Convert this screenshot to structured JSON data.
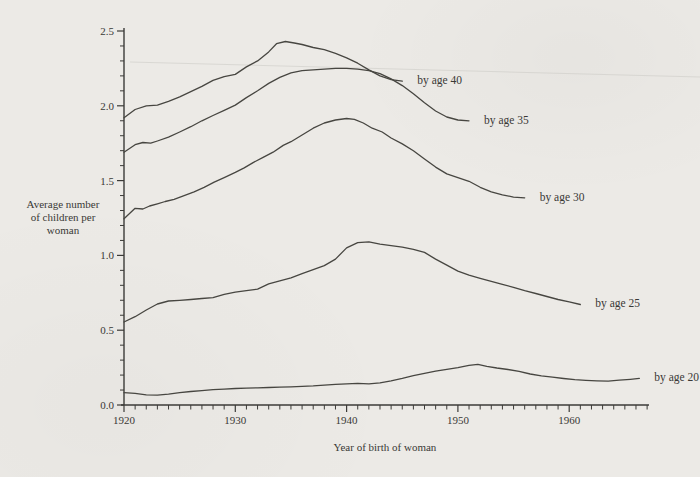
{
  "figure": {
    "colors": {
      "paper": "#eceae6",
      "ink": "#3c3b38",
      "curve": "#474641",
      "artifact": "#cbcac5"
    },
    "y_axis": {
      "title_lines": [
        "Average number",
        "of children per",
        "woman"
      ],
      "range": [
        0,
        2.5
      ],
      "minor_step": 0.1,
      "ticks": [
        {
          "value": 0.0,
          "label": "0.0"
        },
        {
          "value": 0.5,
          "label": "0.5"
        },
        {
          "value": 1.0,
          "label": "1.0"
        },
        {
          "value": 1.5,
          "label": "1.5"
        },
        {
          "value": 2.0,
          "label": "2.0"
        },
        {
          "value": 2.5,
          "label": "2.5"
        }
      ]
    },
    "x_axis": {
      "title": "Year of birth of woman",
      "range": [
        1920,
        1967
      ],
      "minor_step": 1,
      "ticks": [
        {
          "value": 1920,
          "label": "1920"
        },
        {
          "value": 1930,
          "label": "1930"
        },
        {
          "value": 1940,
          "label": "1940"
        },
        {
          "value": 1950,
          "label": "1950"
        },
        {
          "value": 1960,
          "label": "1960"
        }
      ]
    }
  },
  "chart_data": {
    "type": "line",
    "title": "",
    "xlabel": "Year of birth of woman",
    "ylabel": "Average number of children per woman",
    "xlim": [
      1920,
      1967
    ],
    "ylim": [
      0,
      2.5
    ],
    "grid": false,
    "legend_position": "line-ends-right",
    "series": [
      {
        "name": "by age 40",
        "points": [
          [
            1920,
            1.92
          ],
          [
            1921,
            1.975
          ],
          [
            1922,
            2.0
          ],
          [
            1923,
            2.005
          ],
          [
            1924,
            2.03
          ],
          [
            1925,
            2.06
          ],
          [
            1926,
            2.095
          ],
          [
            1927,
            2.13
          ],
          [
            1928,
            2.17
          ],
          [
            1929,
            2.195
          ],
          [
            1930,
            2.21
          ],
          [
            1931,
            2.26
          ],
          [
            1932,
            2.3
          ],
          [
            1933,
            2.36
          ],
          [
            1933.7,
            2.415
          ],
          [
            1934.5,
            2.43
          ],
          [
            1935.3,
            2.42
          ],
          [
            1936,
            2.41
          ],
          [
            1937,
            2.39
          ],
          [
            1938,
            2.375
          ],
          [
            1939,
            2.35
          ],
          [
            1940,
            2.32
          ],
          [
            1941,
            2.285
          ],
          [
            1942,
            2.24
          ],
          [
            1943,
            2.2
          ],
          [
            1944,
            2.175
          ],
          [
            1945,
            2.165
          ]
        ]
      },
      {
        "name": "by age 35",
        "points": [
          [
            1920,
            1.69
          ],
          [
            1921,
            1.74
          ],
          [
            1921.7,
            1.755
          ],
          [
            1922.4,
            1.75
          ],
          [
            1923,
            1.765
          ],
          [
            1924,
            1.79
          ],
          [
            1925,
            1.825
          ],
          [
            1926,
            1.86
          ],
          [
            1927,
            1.9
          ],
          [
            1928,
            1.935
          ],
          [
            1929,
            1.97
          ],
          [
            1930,
            2.005
          ],
          [
            1931,
            2.055
          ],
          [
            1932,
            2.1
          ],
          [
            1933,
            2.15
          ],
          [
            1934,
            2.19
          ],
          [
            1935,
            2.22
          ],
          [
            1936,
            2.235
          ],
          [
            1937,
            2.24
          ],
          [
            1938,
            2.245
          ],
          [
            1939,
            2.25
          ],
          [
            1940,
            2.25
          ],
          [
            1941,
            2.245
          ],
          [
            1942,
            2.235
          ],
          [
            1943,
            2.215
          ],
          [
            1944,
            2.18
          ],
          [
            1945,
            2.135
          ],
          [
            1946,
            2.08
          ],
          [
            1947,
            2.02
          ],
          [
            1948,
            1.965
          ],
          [
            1949,
            1.925
          ],
          [
            1950,
            1.905
          ],
          [
            1951,
            1.9
          ]
        ]
      },
      {
        "name": "by age 30",
        "points": [
          [
            1920,
            1.245
          ],
          [
            1921,
            1.315
          ],
          [
            1921.7,
            1.31
          ],
          [
            1922.3,
            1.33
          ],
          [
            1923,
            1.345
          ],
          [
            1923.7,
            1.36
          ],
          [
            1924.5,
            1.375
          ],
          [
            1925.4,
            1.4
          ],
          [
            1926.3,
            1.425
          ],
          [
            1927.2,
            1.455
          ],
          [
            1928.1,
            1.49
          ],
          [
            1929,
            1.52
          ],
          [
            1930,
            1.555
          ],
          [
            1930.8,
            1.585
          ],
          [
            1931.6,
            1.62
          ],
          [
            1932.5,
            1.655
          ],
          [
            1933.4,
            1.69
          ],
          [
            1934.3,
            1.735
          ],
          [
            1935,
            1.76
          ],
          [
            1936,
            1.805
          ],
          [
            1937,
            1.85
          ],
          [
            1938,
            1.885
          ],
          [
            1939,
            1.905
          ],
          [
            1940,
            1.915
          ],
          [
            1940.7,
            1.91
          ],
          [
            1941.5,
            1.885
          ],
          [
            1942.3,
            1.85
          ],
          [
            1943.2,
            1.825
          ],
          [
            1944,
            1.785
          ],
          [
            1945,
            1.745
          ],
          [
            1946,
            1.7
          ],
          [
            1947,
            1.645
          ],
          [
            1948,
            1.59
          ],
          [
            1949,
            1.545
          ],
          [
            1950,
            1.52
          ],
          [
            1951,
            1.495
          ],
          [
            1952,
            1.455
          ],
          [
            1953,
            1.425
          ],
          [
            1954,
            1.405
          ],
          [
            1955,
            1.39
          ],
          [
            1956,
            1.385
          ]
        ]
      },
      {
        "name": "by age 25",
        "points": [
          [
            1920,
            0.555
          ],
          [
            1921,
            0.59
          ],
          [
            1922,
            0.635
          ],
          [
            1923,
            0.675
          ],
          [
            1924,
            0.695
          ],
          [
            1925,
            0.7
          ],
          [
            1926,
            0.705
          ],
          [
            1927,
            0.712
          ],
          [
            1928,
            0.718
          ],
          [
            1929,
            0.74
          ],
          [
            1930,
            0.755
          ],
          [
            1931,
            0.765
          ],
          [
            1932,
            0.775
          ],
          [
            1933,
            0.81
          ],
          [
            1934,
            0.83
          ],
          [
            1935,
            0.85
          ],
          [
            1936,
            0.878
          ],
          [
            1937,
            0.905
          ],
          [
            1938,
            0.932
          ],
          [
            1939,
            0.975
          ],
          [
            1940,
            1.05
          ],
          [
            1941,
            1.085
          ],
          [
            1942,
            1.09
          ],
          [
            1943,
            1.075
          ],
          [
            1944,
            1.065
          ],
          [
            1945,
            1.055
          ],
          [
            1946,
            1.04
          ],
          [
            1947,
            1.02
          ],
          [
            1948,
            0.975
          ],
          [
            1949,
            0.935
          ],
          [
            1950,
            0.895
          ],
          [
            1951,
            0.868
          ],
          [
            1952,
            0.847
          ],
          [
            1953,
            0.827
          ],
          [
            1954,
            0.807
          ],
          [
            1955,
            0.787
          ],
          [
            1956,
            0.765
          ],
          [
            1957,
            0.745
          ],
          [
            1958,
            0.725
          ],
          [
            1959,
            0.705
          ],
          [
            1960,
            0.69
          ],
          [
            1961,
            0.672
          ]
        ]
      },
      {
        "name": "by age 20",
        "points": [
          [
            1920,
            0.082
          ],
          [
            1921,
            0.078
          ],
          [
            1922,
            0.068
          ],
          [
            1923,
            0.066
          ],
          [
            1924,
            0.073
          ],
          [
            1925,
            0.082
          ],
          [
            1926,
            0.09
          ],
          [
            1927,
            0.096
          ],
          [
            1928,
            0.102
          ],
          [
            1929,
            0.106
          ],
          [
            1930,
            0.11
          ],
          [
            1931,
            0.112
          ],
          [
            1932,
            0.115
          ],
          [
            1933,
            0.117
          ],
          [
            1934,
            0.119
          ],
          [
            1935,
            0.121
          ],
          [
            1936,
            0.124
          ],
          [
            1937,
            0.128
          ],
          [
            1938,
            0.133
          ],
          [
            1939,
            0.138
          ],
          [
            1940,
            0.142
          ],
          [
            1941,
            0.145
          ],
          [
            1942,
            0.142
          ],
          [
            1943,
            0.148
          ],
          [
            1944,
            0.162
          ],
          [
            1945,
            0.178
          ],
          [
            1946,
            0.196
          ],
          [
            1947,
            0.212
          ],
          [
            1948,
            0.226
          ],
          [
            1949,
            0.238
          ],
          [
            1950,
            0.25
          ],
          [
            1951,
            0.265
          ],
          [
            1951.8,
            0.272
          ],
          [
            1952.6,
            0.258
          ],
          [
            1953.5,
            0.247
          ],
          [
            1954.5,
            0.237
          ],
          [
            1955.5,
            0.225
          ],
          [
            1956.5,
            0.207
          ],
          [
            1957.5,
            0.195
          ],
          [
            1958.5,
            0.186
          ],
          [
            1959.5,
            0.177
          ],
          [
            1960.5,
            0.17
          ],
          [
            1961.5,
            0.165
          ],
          [
            1962.5,
            0.162
          ],
          [
            1963.5,
            0.16
          ],
          [
            1964.5,
            0.166
          ],
          [
            1965.5,
            0.172
          ],
          [
            1966.3,
            0.178
          ]
        ]
      }
    ]
  }
}
